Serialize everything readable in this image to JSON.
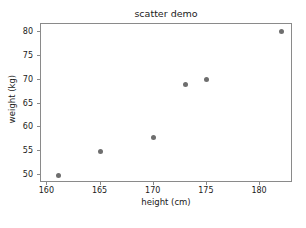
{
  "chart_data": {
    "type": "scatter",
    "title": "scatter demo",
    "xlabel": "height (cm)",
    "ylabel": "weight (kg)",
    "xlim": [
      159.4,
      183.1
    ],
    "ylim": [
      48.4,
      81.6
    ],
    "xticks": [
      160,
      165,
      170,
      175,
      180
    ],
    "yticks": [
      50,
      55,
      60,
      65,
      70,
      75,
      80
    ],
    "xtick_labels": [
      "160",
      "165",
      "170",
      "175",
      "180"
    ],
    "ytick_labels": [
      "50",
      "55",
      "60",
      "65",
      "70",
      "75",
      "80"
    ],
    "grid": false,
    "legend": null,
    "marker_color": "#6e6e6e",
    "frame_color": "#8a8a8a",
    "background": "#ffffff",
    "series": [
      {
        "name": "people",
        "x": [
          161,
          165,
          170,
          173,
          175,
          182
        ],
        "y": [
          50,
          55,
          58,
          69,
          70,
          80
        ]
      }
    ],
    "points": [
      {
        "x": 161,
        "y": 50
      },
      {
        "x": 165,
        "y": 55
      },
      {
        "x": 170,
        "y": 58
      },
      {
        "x": 173,
        "y": 69
      },
      {
        "x": 175,
        "y": 70
      },
      {
        "x": 182,
        "y": 80
      }
    ]
  }
}
